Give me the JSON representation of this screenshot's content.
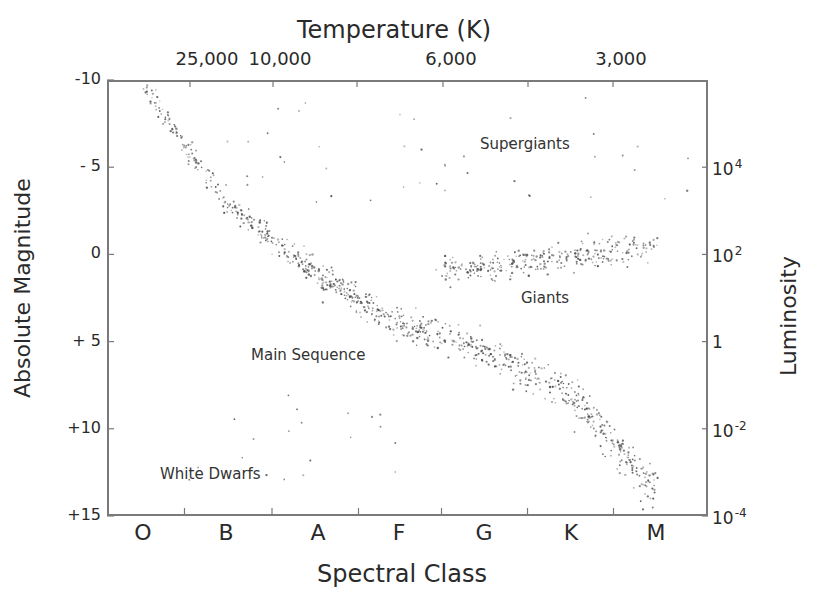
{
  "chart_data": {
    "type": "scatter",
    "top_axis": {
      "label": "Temperature (K)",
      "ticks": [
        {
          "label": "25,000",
          "x": 207
        },
        {
          "label": "10,000",
          "x": 280
        },
        {
          "label": "6,000",
          "x": 451
        },
        {
          "label": "3,000",
          "x": 621
        }
      ]
    },
    "xlabel": "Spectral Class",
    "categories": [
      "O",
      "B",
      "A",
      "F",
      "G",
      "K",
      "M"
    ],
    "ylabel": "Absolute Magnitude",
    "ylim": [
      -10,
      15
    ],
    "y_ticks": [
      "-10",
      "- 5",
      "0",
      "+ 5",
      "+10",
      "+15"
    ],
    "y2label": "Luminosity",
    "y2_ticks": [
      {
        "base": "10",
        "exp": "4",
        "magnitude": -5
      },
      {
        "base": "10",
        "exp": "2",
        "magnitude": 0
      },
      {
        "base": "1",
        "exp": "",
        "magnitude": 5
      },
      {
        "base": "10",
        "exp": "-2",
        "magnitude": 10
      },
      {
        "base": "10",
        "exp": "-4",
        "magnitude": 15
      }
    ],
    "grid": false,
    "annotations": [
      {
        "text": "Supergiants",
        "x_class": "K",
        "magnitude": -5.6
      },
      {
        "text": "Giants",
        "x_class": "K",
        "magnitude": 2.8
      },
      {
        "text": "Main Sequence",
        "x_class": "A",
        "magnitude": 6.0
      },
      {
        "text": "White Dwarfs",
        "x_class": "B",
        "magnitude": 12.6
      }
    ],
    "series": [
      {
        "name": "Main Sequence",
        "approx_points": 900,
        "trend": [
          {
            "class_index": 0.0,
            "magnitude": -9.5
          },
          {
            "class_index": 1.0,
            "magnitude": -3.0
          },
          {
            "class_index": 2.0,
            "magnitude": 1.2
          },
          {
            "class_index": 3.0,
            "magnitude": 4.0
          },
          {
            "class_index": 4.0,
            "magnitude": 5.5
          },
          {
            "class_index": 5.0,
            "magnitude": 8.0
          },
          {
            "class_index": 6.0,
            "magnitude": 13.5
          }
        ]
      },
      {
        "name": "Giants",
        "approx_points": 320,
        "trend": [
          {
            "class_index": 3.5,
            "magnitude": 1.0
          },
          {
            "class_index": 4.5,
            "magnitude": 0.5
          },
          {
            "class_index": 5.5,
            "magnitude": -0.3
          },
          {
            "class_index": 6.0,
            "magnitude": -0.5
          }
        ]
      },
      {
        "name": "Supergiants",
        "approx_points": 45,
        "magnitude_range": [
          -9,
          -3
        ],
        "class_range": [
          1,
          6.5
        ]
      },
      {
        "name": "White Dwarfs",
        "approx_points": 20,
        "magnitude_range": [
          8,
          13
        ],
        "class_range": [
          0.5,
          3
        ]
      }
    ]
  },
  "plot_area": {
    "left": 107,
    "top": 80,
    "right": 708,
    "bottom": 516
  },
  "class_positions": [
    143,
    226,
    318,
    399,
    484,
    571,
    656
  ],
  "colors": {
    "frame": "#7a7a7a",
    "text": "#2a2a2a",
    "points": "#4a4a4a"
  }
}
